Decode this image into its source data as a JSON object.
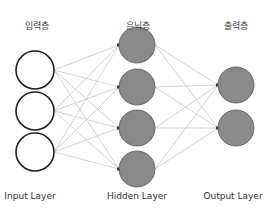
{
  "layers": [
    {
      "korean_label": "입력층",
      "english_label": "Input Layer",
      "node_count": 3,
      "style": "hollow"
    },
    {
      "korean_label": "은닉층",
      "english_label": "Hidden Layer",
      "node_count": 4,
      "style": "filled"
    },
    {
      "korean_label": "출력층",
      "english_label": "Output Layer",
      "node_count": 2,
      "style": "filled"
    }
  ],
  "colors": {
    "node_fill": "#8a8a8a",
    "node_stroke": "#555555",
    "input_stroke": "#222222",
    "edge": "#c8c8c8",
    "arrow": "#333333"
  }
}
